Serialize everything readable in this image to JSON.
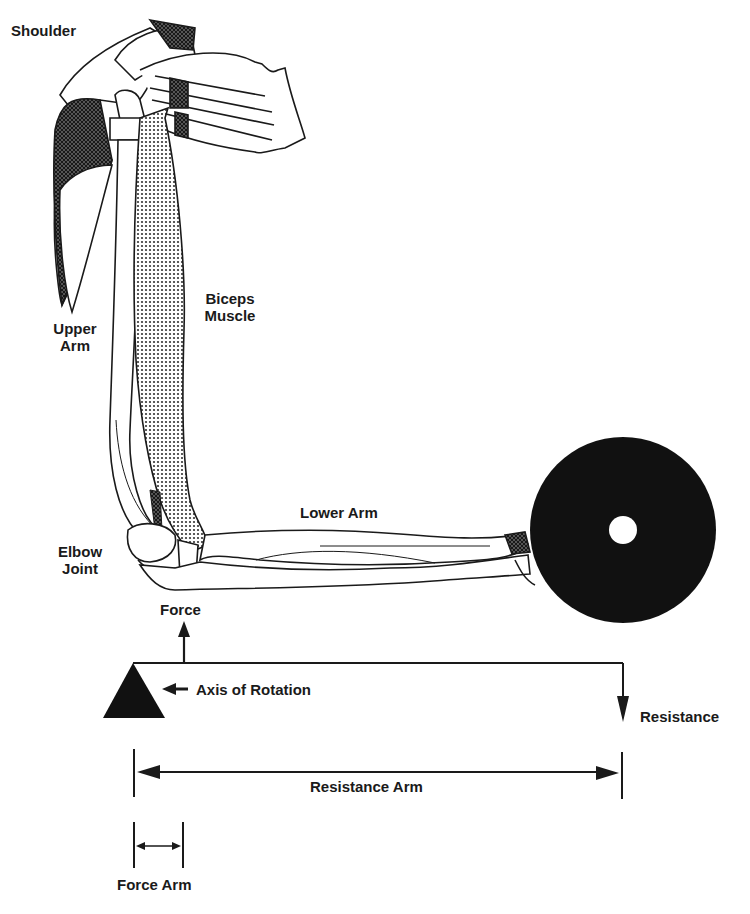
{
  "diagram": {
    "type": "anatomical lever diagram",
    "colors": {
      "ink": "#1a1a1a",
      "background": "#ffffff",
      "weight": "#111111"
    },
    "anatomy_labels": {
      "shoulder": "Shoulder",
      "upper_arm_line1": "Upper",
      "upper_arm_line2": "Arm",
      "biceps_line1": "Biceps",
      "biceps_line2": "Muscle",
      "lower_arm": "Lower Arm",
      "elbow_line1": "Elbow",
      "elbow_line2": "Joint"
    },
    "lever_labels": {
      "force": "Force",
      "axis_of_rotation": "Axis of Rotation",
      "resistance": "Resistance",
      "resistance_arm": "Resistance Arm",
      "force_arm": "Force Arm"
    },
    "icons": {
      "fulcrum": "triangle-fulcrum-icon",
      "weight": "weight-plate-icon",
      "force_arrow": "arrow-up-icon",
      "resistance_arrow": "arrow-down-icon",
      "axis_arrow": "arrow-left-icon"
    }
  }
}
